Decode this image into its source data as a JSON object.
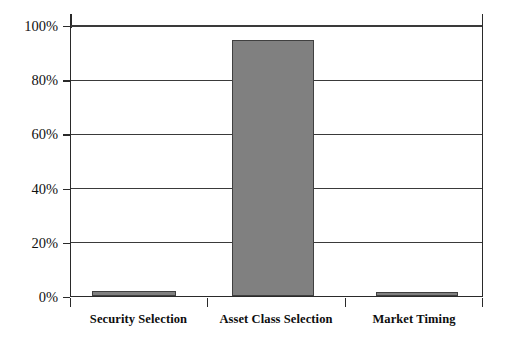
{
  "chart_data": {
    "type": "bar",
    "title": "",
    "subtitle": "",
    "xlabel": "",
    "ylabel": "",
    "categories": [
      "Security Selection",
      "Asset Class Selection",
      "Market Timing"
    ],
    "values": [
      2,
      95,
      1.5
    ],
    "value_labels": [
      "2%",
      "95%",
      "1.5%"
    ],
    "series": [
      {
        "name": "Contribution",
        "values": [
          2,
          95,
          1.5
        ]
      }
    ],
    "ylim": [
      0,
      100
    ],
    "ytick_values": [
      0,
      20,
      40,
      60,
      80,
      100
    ],
    "ytick_labels": [
      "0%",
      "20%",
      "40%",
      "60%",
      "80%",
      "100%"
    ],
    "grid": true,
    "grid_axis": "y",
    "legend": false,
    "legend_position": "none",
    "bar_color": "#808080",
    "bar_border_color": "#404040",
    "axis_color": "#2a2a2a",
    "grid_color": "#3a3a3a",
    "background_color": "#ffffff",
    "annotations": []
  }
}
